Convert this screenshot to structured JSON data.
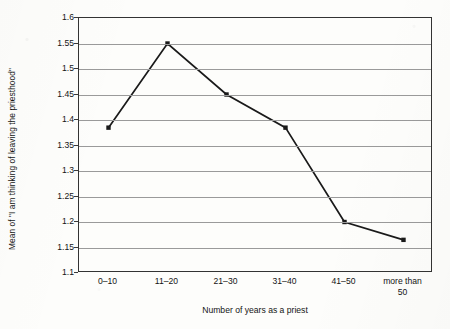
{
  "chart_data": {
    "type": "line",
    "title": "",
    "xlabel": "Number of years as a priest",
    "ylabel": "Mean of \"I am thinking of leaving the priesthood\"",
    "categories": [
      "0–10",
      "11–20",
      "21–30",
      "31–40",
      "41–50",
      "more than\n50"
    ],
    "category_labels_flat": [
      "0–10",
      "11–20",
      "21–30",
      "31–40",
      "41–50",
      "more than 50"
    ],
    "values": [
      1.385,
      1.55,
      1.45,
      1.385,
      1.2,
      1.165
    ],
    "ylim": [
      1.1,
      1.6
    ],
    "ytick_step": 0.05,
    "ytick_labels": [
      "1.6",
      "1.55",
      "1.5",
      "1.45",
      "1.4",
      "1.35",
      "1.3",
      "1.25",
      "1.2",
      "1.15",
      "1.1"
    ],
    "grid": true,
    "legend": "none",
    "marker": "square",
    "series_color": "#1a1a1a",
    "grid_color": "#9a9a9a",
    "frame_color": "#333333",
    "background_color": "#fdfdfb"
  }
}
